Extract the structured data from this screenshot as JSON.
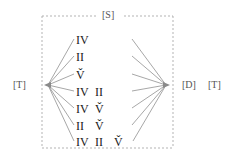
{
  "figure": {
    "width": 238,
    "height": 161,
    "background_color": "#ffffff",
    "type": "fan-lattice-diagram"
  },
  "labels": {
    "source": "[S]",
    "left_terminal": "[T]",
    "destination": "[D]",
    "right_terminal": "[T]"
  },
  "box": {
    "style": "dashed",
    "color": "#999999",
    "x": 42,
    "y": 16,
    "width": 131,
    "height": 132
  },
  "nodes": {
    "left_point": {
      "x": 48,
      "y": 85,
      "marker": "arrowhead-left"
    },
    "right_point": {
      "x": 166,
      "y": 85,
      "marker": "arrowhead-right"
    }
  },
  "rows": [
    {
      "index": 0,
      "y": 33,
      "glyphs": [
        "IV"
      ]
    },
    {
      "index": 1,
      "y": 50,
      "glyphs": [
        "II"
      ]
    },
    {
      "index": 2,
      "y": 68,
      "glyphs": [
        "V̌"
      ]
    },
    {
      "index": 3,
      "y": 85,
      "glyphs": [
        "IV",
        "II"
      ]
    },
    {
      "index": 4,
      "y": 102,
      "glyphs": [
        "IV",
        "V̌"
      ]
    },
    {
      "index": 5,
      "y": 119,
      "glyphs": [
        "II",
        "V̌"
      ]
    },
    {
      "index": 6,
      "y": 135,
      "glyphs": [
        "IV",
        "II",
        "V̌"
      ]
    }
  ],
  "edges": {
    "color": "#8a8a8a",
    "left_fan_count": 7,
    "right_fan_count": 7
  },
  "colors": {
    "line": "#8a8a8a",
    "dash": "#aaaaaa",
    "text": "#1a1a1a",
    "label_text": "#555555"
  }
}
